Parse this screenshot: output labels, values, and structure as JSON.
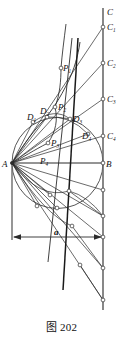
{
  "figure": {
    "caption": "图 202",
    "colors": {
      "stroke": "#2b2b2b",
      "thick_stroke": "#555555",
      "label": "#111111",
      "background": "#ffffff",
      "marker_fill": "#ffffff"
    },
    "geometry": {
      "point_A": {
        "x": 12,
        "y": 163
      },
      "point_B": {
        "x": 103,
        "y": 163
      },
      "circle": {
        "cx": 57.5,
        "cy": 163,
        "r": 45.5
      },
      "right_vertical_line": {
        "x": 103,
        "y1": 8,
        "y2": 310
      },
      "left_vertical_line": {
        "x": 12,
        "y1": 163,
        "y2": 240
      },
      "dimension_line": {
        "x1": 12,
        "x2": 103,
        "y": 237
      }
    },
    "labels": {
      "A": {
        "text": "A",
        "x": 2,
        "y": 167,
        "size": 9
      },
      "B": {
        "text": "B",
        "x": 106,
        "y": 167,
        "size": 9
      },
      "C": {
        "text": "C",
        "x": 107,
        "y": 15,
        "size": 9
      },
      "C1": {
        "base": "C",
        "sub": "1",
        "x": 107,
        "y": 30,
        "size": 9
      },
      "C2": {
        "base": "C",
        "sub": "2",
        "x": 107,
        "y": 66,
        "size": 9
      },
      "C3": {
        "base": "C",
        "sub": "3",
        "x": 107,
        "y": 102,
        "size": 9
      },
      "C4": {
        "base": "C",
        "sub": "4",
        "x": 107,
        "y": 139,
        "size": 9
      },
      "P1": {
        "base": "P",
        "sub": "1",
        "x": 63,
        "y": 71,
        "size": 9
      },
      "P2": {
        "base": "P",
        "sub": "2",
        "x": 58,
        "y": 110,
        "size": 9
      },
      "P3": {
        "base": "P",
        "sub": "3",
        "x": 51,
        "y": 146,
        "size": 9
      },
      "P4": {
        "base": "P",
        "sub": "4",
        "x": 40,
        "y": 164,
        "size": 9
      },
      "D1": {
        "base": "D",
        "sub": "1",
        "x": 29,
        "y": 120,
        "size": 9
      },
      "D2": {
        "base": "D",
        "sub": "2",
        "x": 42,
        "y": 115,
        "size": 9
      },
      "D3": {
        "base": "D",
        "sub": "3",
        "x": 75,
        "y": 122,
        "size": 9
      },
      "D4": {
        "base": "D",
        "sub": "4",
        "x": 84,
        "y": 137,
        "size": 9
      },
      "a": {
        "text": "a",
        "x": 54,
        "y": 235,
        "size": 9
      }
    },
    "markers": [
      {
        "name": "C1",
        "x": 103,
        "y": 27
      },
      {
        "name": "C2",
        "x": 103,
        "y": 63
      },
      {
        "name": "C3",
        "x": 103,
        "y": 99
      },
      {
        "name": "C4",
        "x": 103,
        "y": 136
      },
      {
        "name": "B",
        "x": 103,
        "y": 163
      },
      {
        "name": "R1",
        "x": 103,
        "y": 190
      },
      {
        "name": "R2",
        "x": 103,
        "y": 216
      },
      {
        "name": "R3",
        "x": 103,
        "y": 237
      },
      {
        "name": "R4",
        "x": 103,
        "y": 268
      },
      {
        "name": "R5",
        "x": 103,
        "y": 300
      },
      {
        "name": "P1",
        "x": 61,
        "y": 68
      },
      {
        "name": "P2",
        "x": 55,
        "y": 107
      },
      {
        "name": "P3",
        "x": 48,
        "y": 143
      },
      {
        "name": "D1",
        "x": 33,
        "y": 122
      },
      {
        "name": "D2",
        "x": 47,
        "y": 117
      },
      {
        "name": "D3",
        "x": 70,
        "y": 119
      },
      {
        "name": "D4",
        "x": 88,
        "y": 134
      },
      {
        "name": "L1",
        "x": 50,
        "y": 195
      },
      {
        "name": "L2",
        "x": 69,
        "y": 191
      },
      {
        "name": "L3",
        "x": 37,
        "y": 206
      },
      {
        "name": "L4",
        "x": 57,
        "y": 208
      },
      {
        "name": "L5",
        "x": 72,
        "y": 226
      },
      {
        "name": "L6",
        "x": 80,
        "y": 265
      }
    ]
  }
}
